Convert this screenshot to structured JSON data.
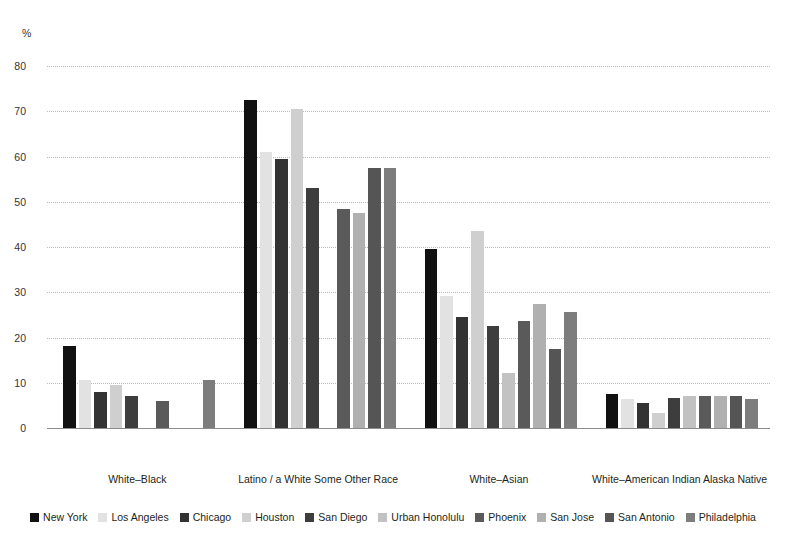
{
  "title": "Figure 4. Percentage of Multiracial Population by Largest Categories, 2020",
  "y_unit": "%",
  "chart_data": {
    "type": "bar",
    "title": "Figure 4. Percentage of Multiracial Population by Largest Categories, 2020",
    "xlabel": "",
    "ylabel": "%",
    "ylim": [
      0,
      80
    ],
    "yticks": [
      0,
      10,
      20,
      30,
      40,
      50,
      60,
      70,
      80
    ],
    "grid": true,
    "legend_position": "bottom",
    "categories": [
      "White–Black",
      "Latino / a White Some Other Race",
      "White–Asian",
      "White–American Indian Alaska Native"
    ],
    "series": [
      {
        "name": "New York",
        "color": "#111111",
        "values": [
          18.2,
          72.4,
          39.5,
          7.5
        ]
      },
      {
        "name": "Los Angeles",
        "color": "#e2e2e2",
        "values": [
          10.6,
          61.0,
          29.2,
          6.5
        ]
      },
      {
        "name": "Chicago",
        "color": "#333333",
        "values": [
          8.0,
          59.4,
          24.5,
          5.5
        ]
      },
      {
        "name": "Houston",
        "color": "#cfcfcf",
        "values": [
          9.6,
          70.6,
          43.6,
          3.4
        ]
      },
      {
        "name": "San Diego",
        "color": "#3d3d3d",
        "values": [
          7.0,
          53.1,
          22.6,
          6.6
        ]
      },
      {
        "name": "Urban Honolulu",
        "color": "#c2c2c2",
        "values": [
          null,
          null,
          12.1,
          7.0
        ]
      },
      {
        "name": "Phoenix",
        "color": "#5a5a5a",
        "values": [
          6.0,
          48.5,
          23.7,
          7.1
        ]
      },
      {
        "name": "San Jose",
        "color": "#b0b0b0",
        "values": [
          null,
          47.5,
          27.4,
          7.0
        ]
      },
      {
        "name": "San Antonio",
        "color": "#555555",
        "values": [
          null,
          57.5,
          17.4,
          7.1
        ]
      },
      {
        "name": "Philadelphia",
        "color": "#7d7d7d",
        "values": [
          10.7,
          57.5,
          25.6,
          6.4
        ]
      }
    ]
  },
  "legend": {
    "items": [
      {
        "label": "New York"
      },
      {
        "label": "Los Angeles"
      },
      {
        "label": "Chicago"
      },
      {
        "label": "Houston"
      },
      {
        "label": "San Diego"
      },
      {
        "label": "Urban Honolulu"
      },
      {
        "label": "Phoenix"
      },
      {
        "label": "San Jose"
      },
      {
        "label": "San Antonio"
      },
      {
        "label": "Philadelphia"
      }
    ]
  }
}
